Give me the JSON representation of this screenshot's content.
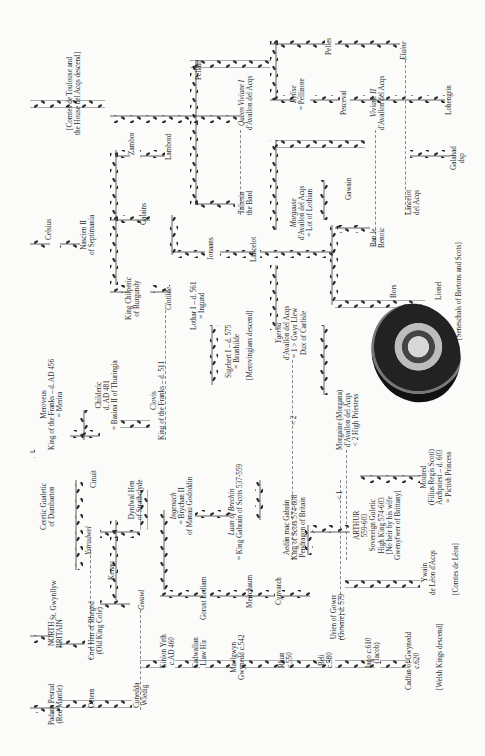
{
  "headings": {
    "north_britain": [
      "NORTH",
      "BRITAIN"
    ],
    "merovingian": [
      "MEROVINGIAN",
      "KINGS OF THE FRANKS"
    ]
  },
  "people": [
    {
      "id": "padarn",
      "lines": [
        "Padarn Pesrud",
        "(Red Mantle)"
      ],
      "x": 48,
      "y": 725
    },
    {
      "id": "oetern",
      "lines": [
        "Oetern"
      ],
      "x": 88,
      "y": 708
    },
    {
      "id": "cunedda",
      "lines": [
        "Cunedda",
        "Wledig"
      ],
      "x": 133,
      "y": 708
    },
    {
      "id": "einion",
      "lines": [
        "Einion Yrth",
        "c.AD 460"
      ],
      "x": 160,
      "y": 668
    },
    {
      "id": "cadwallan",
      "lines": [
        "Cadwallan",
        "Llaw Hir"
      ],
      "x": 192,
      "y": 668
    },
    {
      "id": "maelgwyn",
      "lines": [
        "Maelgwyn",
        "Gwynedd c.542"
      ],
      "x": 230,
      "y": 680
    },
    {
      "id": "rhun",
      "lines": [
        "Rhun",
        "c.550"
      ],
      "x": 278,
      "y": 668
    },
    {
      "id": "beli",
      "lines": [
        "Beli",
        "c.580"
      ],
      "x": 318,
      "y": 668
    },
    {
      "id": "iago",
      "lines": [
        "Iago c.610",
        "(Jacob)"
      ],
      "x": 365,
      "y": 668
    },
    {
      "id": "cadfan",
      "lines": [
        "Cadfan of Gwynedd",
        "c.620"
      ],
      "x": 405,
      "y": 690
    },
    {
      "id": "welsh_kings",
      "lines": [
        "[Welsh Kings descend]"
      ],
      "x": 436,
      "y": 690
    },
    {
      "id": "north_britain",
      "lines": [
        "NORTH",
        "BRITAIN"
      ],
      "x": 48,
      "y": 648
    },
    {
      "id": "st_gwynllyw",
      "lines": [
        "St. Gwynllyw"
      ],
      "x": 50,
      "y": 620
    },
    {
      "id": "coel_hen",
      "lines": [
        "Coel Hen of Rheged",
        "(Old King Cole)"
      ],
      "x": 88,
      "y": 660
    },
    {
      "id": "gwawl",
      "lines": [
        "Gwawl"
      ],
      "x": 138,
      "y": 610,
      "italic": true
    },
    {
      "id": "kenau",
      "lines": [
        "Kenau"
      ],
      "x": 108,
      "y": 580
    },
    {
      "id": "gorust",
      "lines": [
        "Gorust Lediam"
      ],
      "x": 200,
      "y": 620
    },
    {
      "id": "meirchaum",
      "lines": [
        "Meirchaum"
      ],
      "x": 246,
      "y": 608
    },
    {
      "id": "cynvarch",
      "lines": [
        "Cynvarch"
      ],
      "x": 275,
      "y": 605
    },
    {
      "id": "urien",
      "lines": [
        "Urien of Gowrr",
        "(Gowrie) d. 579"
      ],
      "x": 330,
      "y": 640
    },
    {
      "id": "ywain",
      "lines": [
        "Ywain",
        "de Léon d'Acqs"
      ],
      "x": 421,
      "y": 595
    },
    {
      "id": "comtes_leon",
      "lines": [
        "[Comtes de Léon]"
      ],
      "x": 452,
      "y": 595
    },
    {
      "id": "ceretic",
      "lines": [
        "Ceretic Gualetic",
        "of Dumbarton"
      ],
      "x": 40,
      "y": 530
    },
    {
      "id": "ystradwel",
      "lines": [
        "Ystradwel"
      ],
      "x": 85,
      "y": 555,
      "italic": true
    },
    {
      "id": "cinuit",
      "lines": [
        "Cinuit"
      ],
      "x": 90,
      "y": 488
    },
    {
      "id": "dynfwal",
      "lines": [
        "Dynfwal Hen",
        "of Strathclyde"
      ],
      "x": 128,
      "y": 520
    },
    {
      "id": "ingenach",
      "lines": [
        "Ingenach",
        "= Brychan II",
        "of Manau Gododdin"
      ],
      "x": 170,
      "y": 535,
      "italicFirst": true
    },
    {
      "id": "luan",
      "lines": [
        "Luan of Brechin",
        "= King Gabrain of Scots 537-559"
      ],
      "x": 228,
      "y": 560,
      "italicFirst": true
    },
    {
      "id": "aedan",
      "lines": [
        "Aedán mac Gabrán",
        "King of Scots 574-608",
        "Pendragon of Britain"
      ],
      "x": 283,
      "y": 560
    },
    {
      "id": "arthur",
      "lines": [
        "ARTHUR",
        "559-603",
        "Sovereign Guletic",
        "High King 574-603",
        "[No heir by his wife",
        "Gwenyfwer of Brittany]"
      ],
      "x": 353,
      "y": 560
    },
    {
      "id": "mordred",
      "lines": [
        "Modred",
        "(Filius Regis Scoti)",
        "Archpriest – d. 603",
        "= Pictish Princess"
      ],
      "x": 420,
      "y": 505
    },
    {
      "id": "morgaine",
      "lines": [
        "Morgaine (Morgana)",
        "d'Avallon del Acqs",
        "< 2 High Priestess"
      ],
      "x": 336,
      "y": 450
    },
    {
      "id": "merovee",
      "lines": [
        "Meroveus",
        "King of the Franks – d. AD 456",
        "= Merira"
      ],
      "x": 40,
      "y": 450
    },
    {
      "id": "childeric",
      "lines": [
        "Childeric",
        "d. AD 481",
        "= Basina II of Thuringia"
      ],
      "x": 95,
      "y": 430
    },
    {
      "id": "clovis",
      "lines": [
        "Clovis",
        "King of the Franks – d. 511"
      ],
      "x": 150,
      "y": 440
    },
    {
      "id": "chilperic",
      "lines": [
        "King Chilperic",
        "of Burgundy"
      ],
      "x": 125,
      "y": 320
    },
    {
      "id": "clotilde",
      "lines": [
        "Clotilde"
      ],
      "x": 165,
      "y": 310,
      "italic": true
    },
    {
      "id": "lothar",
      "lines": [
        "Lothar I – d. 561",
        "= Ingund"
      ],
      "x": 190,
      "y": 330
    },
    {
      "id": "sigebert",
      "lines": [
        "Sigebert I – d. 575",
        "= Brunhilde"
      ],
      "x": 225,
      "y": 378
    },
    {
      "id": "merov_descend",
      "lines": [
        "[Merovingians descend]"
      ],
      "x": 246,
      "y": 380
    },
    {
      "id": "ygerna",
      "lines": [
        "Ygerna",
        "d'Avallon del Acqs",
        "= 1 > Gwyr Llew",
        "Dux of Carlisle"
      ],
      "x": 275,
      "y": 360,
      "italicFirst": true
    },
    {
      "id": "celsius",
      "lines": [
        "Celsius"
      ],
      "x": 45,
      "y": 240
    },
    {
      "id": "nascien",
      "lines": [
        "Nascien II",
        "of Septimania"
      ],
      "x": 80,
      "y": 255
    },
    {
      "id": "galains",
      "lines": [
        "Galains"
      ],
      "x": 140,
      "y": 225
    },
    {
      "id": "jonaans",
      "lines": [
        "Jonaans"
      ],
      "x": 207,
      "y": 260
    },
    {
      "id": "lancelot1",
      "lines": [
        "Lancelot"
      ],
      "x": 250,
      "y": 262
    },
    {
      "id": "zambor",
      "lines": [
        "Zambor"
      ],
      "x": 128,
      "y": 155
    },
    {
      "id": "lambord",
      "lines": [
        "Lambord"
      ],
      "x": 165,
      "y": 160
    },
    {
      "id": "taliesin",
      "lines": [
        "Taliesin",
        "the Bard"
      ],
      "x": 238,
      "y": 215
    },
    {
      "id": "vivienne1",
      "lines": [
        "Queen Viviane I",
        "d'Avallon del Acqs"
      ],
      "x": 238,
      "y": 130,
      "italicFirst": true
    },
    {
      "id": "comtes_toulouse",
      "lines": [
        "[Comtes de Toulouse and",
        "the House del Acqs descend]"
      ],
      "x": 66,
      "y": 135
    },
    {
      "id": "morgause",
      "lines": [
        "Morgause",
        "d'Avallon del Acqs",
        "= Lot of Lothian"
      ],
      "x": 290,
      "y": 240,
      "italicFirst": true
    },
    {
      "id": "gawain",
      "lines": [
        "Gawain"
      ],
      "x": 345,
      "y": 200
    },
    {
      "id": "ban",
      "lines": [
        "Ban le",
        "Benoic"
      ],
      "x": 370,
      "y": 248
    },
    {
      "id": "bors",
      "lines": [
        "Bors"
      ],
      "x": 390,
      "y": 298
    },
    {
      "id": "lionel",
      "lines": [
        "Lionel"
      ],
      "x": 435,
      "y": 300
    },
    {
      "id": "seneschals",
      "lines": [
        "[Seneschals of Bretons and Scots]"
      ],
      "x": 455,
      "y": 340
    },
    {
      "id": "vivienne2",
      "lines": [
        "Viviane II",
        "d'Avallon del Acqs"
      ],
      "x": 370,
      "y": 130,
      "italicFirst": true
    },
    {
      "id": "lancelot2",
      "lines": [
        "Lancelot",
        "del Acqs"
      ],
      "x": 405,
      "y": 215
    },
    {
      "id": "galahad",
      "lines": [
        "Galahad",
        "dsp"
      ],
      "x": 450,
      "y": 170
    },
    {
      "id": "pellam",
      "lines": [
        "Pellam"
      ],
      "x": 195,
      "y": 80
    },
    {
      "id": "pelles",
      "lines": [
        "Pelles"
      ],
      "x": 325,
      "y": 55
    },
    {
      "id": "eylise",
      "lines": [
        "Eylise",
        "= Pellinore"
      ],
      "x": 290,
      "y": 110,
      "italicFirst": true
    },
    {
      "id": "perceval",
      "lines": [
        "Perceval"
      ],
      "x": 340,
      "y": 115
    },
    {
      "id": "elaine",
      "lines": [
        "Elaine"
      ],
      "x": 400,
      "y": 60,
      "italic": true
    },
    {
      "id": "lohengrin",
      "lines": [
        "Lohengrin"
      ],
      "x": 445,
      "y": 115
    }
  ],
  "marriage_marks": [
    {
      "label": "< 1",
      "x": 336,
      "y": 500
    },
    {
      "label": "< 2",
      "x": 290,
      "y": 425
    }
  ],
  "illustration": {
    "name": "circular-illuminated-emblem"
  }
}
